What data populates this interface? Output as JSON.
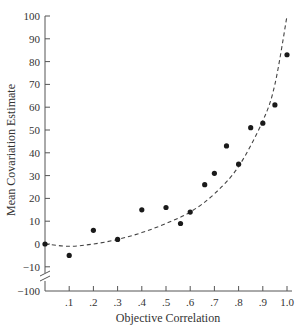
{
  "chart_data": {
    "type": "scatter",
    "title": "",
    "xlabel": "Objective Correlation",
    "ylabel": "Mean Covariation Estimate",
    "x_ticks": [
      ".1",
      ".2",
      ".3",
      ".4",
      ".5",
      ".6",
      ".7",
      ".8",
      ".9",
      "1.0"
    ],
    "x_tick_values": [
      0.1,
      0.2,
      0.3,
      0.4,
      0.5,
      0.6,
      0.7,
      0.8,
      0.9,
      1.0
    ],
    "y_ticks": [
      "100",
      "90",
      "80",
      "70",
      "60",
      "50",
      "40",
      "30",
      "20",
      "10",
      "0",
      "−10",
      "−100"
    ],
    "y_tick_values": [
      100,
      90,
      80,
      70,
      60,
      50,
      40,
      30,
      20,
      10,
      0,
      -10
    ],
    "y_axis_break": {
      "below": -10,
      "bottom_label": "−100"
    },
    "xlim": [
      0,
      1.0
    ],
    "ylim": [
      -10,
      100
    ],
    "grid": false,
    "legend": null,
    "series": [
      {
        "name": "Observed estimates",
        "marker": "filled-circle",
        "points": [
          [
            0.0,
            0
          ],
          [
            0.1,
            -5
          ],
          [
            0.2,
            6
          ],
          [
            0.3,
            2
          ],
          [
            0.4,
            15
          ],
          [
            0.5,
            16
          ],
          [
            0.56,
            9
          ],
          [
            0.6,
            14
          ],
          [
            0.66,
            26
          ],
          [
            0.7,
            31
          ],
          [
            0.75,
            43
          ],
          [
            0.8,
            35
          ],
          [
            0.85,
            51
          ],
          [
            0.9,
            53
          ],
          [
            0.95,
            61
          ],
          [
            1.0,
            83
          ]
        ]
      },
      {
        "name": "Fitted curve",
        "style": "dashed",
        "points": [
          [
            0.0,
            0
          ],
          [
            0.1,
            -1
          ],
          [
            0.2,
            0
          ],
          [
            0.3,
            2
          ],
          [
            0.4,
            5
          ],
          [
            0.5,
            9
          ],
          [
            0.6,
            14
          ],
          [
            0.7,
            22
          ],
          [
            0.8,
            34
          ],
          [
            0.9,
            54
          ],
          [
            0.95,
            70
          ],
          [
            1.0,
            100
          ]
        ]
      }
    ]
  }
}
